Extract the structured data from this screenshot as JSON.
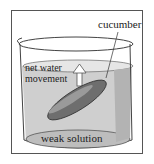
{
  "diagram": {
    "labels": {
      "object": "cucumber",
      "arrow_line1": "net water",
      "arrow_line2": "movement",
      "solution": "weak solution"
    },
    "colors": {
      "liquid": "#c9c9c9",
      "cucumber": "#6e6e6e",
      "frame": "#555555"
    }
  }
}
